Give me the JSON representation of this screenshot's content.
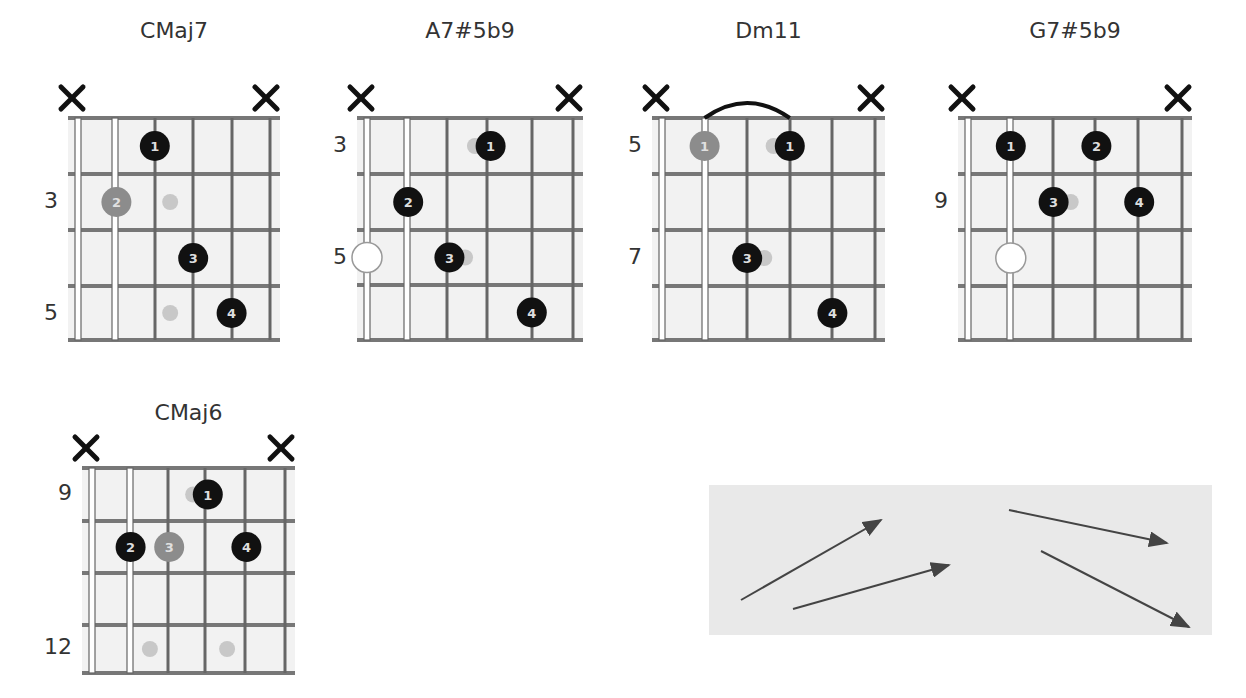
{
  "chords": [
    {
      "name": "CMaj7",
      "title_x": 68,
      "title_y": 18,
      "strings_x": [
        78,
        115,
        155,
        193,
        232,
        270
      ],
      "frets_y": [
        118,
        174,
        230,
        286,
        340
      ],
      "fret_labels": [
        {
          "text": "3",
          "y": 202
        },
        {
          "text": "5",
          "y": 314
        }
      ],
      "label_x": 24,
      "muted": [
        0,
        5
      ],
      "dots": [
        {
          "string": 2,
          "fret": 0,
          "finger": "1",
          "style": "black"
        },
        {
          "string": 1,
          "fret": 1,
          "finger": "2",
          "style": "gray"
        },
        {
          "string": 3,
          "fret": 2,
          "finger": "3",
          "style": "black"
        },
        {
          "string": 4,
          "fret": 3,
          "finger": "4",
          "style": "black"
        }
      ],
      "ghosts": [
        {
          "string": 2.4,
          "fret": 1
        },
        {
          "string": 2.4,
          "fret": 3
        }
      ],
      "open_circles": [],
      "barre": null
    },
    {
      "name": "A7#5b9",
      "title_x": 360,
      "title_y": 18,
      "strings_x": [
        367,
        407,
        447,
        487,
        532,
        573
      ],
      "frets_y": [
        118,
        174,
        230,
        285,
        340
      ],
      "fret_labels": [
        {
          "text": "3",
          "y": 146
        },
        {
          "text": "5",
          "y": 258
        }
      ],
      "label_x": 314,
      "muted": [
        0,
        5
      ],
      "dots": [
        {
          "string": 3,
          "fret": 0,
          "finger": "1",
          "style": "black"
        },
        {
          "string": 1,
          "fret": 1,
          "finger": "2",
          "style": "black"
        },
        {
          "string": 2,
          "fret": 2,
          "finger": "3",
          "style": "black"
        },
        {
          "string": 4,
          "fret": 3,
          "finger": "4",
          "style": "black"
        }
      ],
      "ghosts": [
        {
          "string": 2.62,
          "fret": 0
        },
        {
          "string": 2.38,
          "fret": 2
        }
      ],
      "open_circles": [
        {
          "string": 0,
          "fret": 2
        }
      ],
      "barre": null
    },
    {
      "name": "Dm11",
      "title_x": 660,
      "title_y": 18,
      "strings_x": [
        662,
        705,
        747,
        790,
        832,
        875
      ],
      "frets_y": [
        118,
        174,
        230,
        286,
        340
      ],
      "fret_labels": [
        {
          "text": "5",
          "y": 146
        },
        {
          "text": "7",
          "y": 258
        }
      ],
      "label_x": 606,
      "muted": [
        0,
        5
      ],
      "dots": [
        {
          "string": 1,
          "fret": 0,
          "finger": "1",
          "style": "gray"
        },
        {
          "string": 3,
          "fret": 0,
          "finger": "1",
          "style": "black"
        },
        {
          "string": 2,
          "fret": 2,
          "finger": "3",
          "style": "black"
        },
        {
          "string": 4,
          "fret": 3,
          "finger": "4",
          "style": "black"
        }
      ],
      "ghosts": [
        {
          "string": 2.62,
          "fret": 0
        },
        {
          "string": 2.4,
          "fret": 2
        }
      ],
      "open_circles": [],
      "barre": {
        "from": 1,
        "to": 3
      }
    },
    {
      "name": "G7#5b9",
      "title_x": 965,
      "title_y": 18,
      "strings_x": [
        968,
        1010,
        1053,
        1095,
        1138,
        1182
      ],
      "frets_y": [
        118,
        174,
        230,
        286,
        340
      ],
      "fret_labels": [
        {
          "text": "9",
          "y": 202
        }
      ],
      "label_x": 914,
      "muted": [
        0,
        5
      ],
      "dots": [
        {
          "string": 1,
          "fret": 0,
          "finger": "1",
          "style": "black"
        },
        {
          "string": 3,
          "fret": 0,
          "finger": "2",
          "style": "black"
        },
        {
          "string": 2,
          "fret": 1,
          "finger": "3",
          "style": "black"
        },
        {
          "string": 4,
          "fret": 1,
          "finger": "4",
          "style": "black"
        }
      ],
      "ghosts": [
        {
          "string": 2.4,
          "fret": 1
        }
      ],
      "open_circles": [
        {
          "string": 1,
          "fret": 2
        }
      ],
      "barre": null
    },
    {
      "name": "CMaj6",
      "title_x": 78,
      "title_y": 400,
      "strings_x": [
        92,
        130,
        168,
        205,
        245,
        285
      ],
      "frets_y": [
        468,
        521,
        573,
        625,
        673
      ],
      "fret_labels": [
        {
          "text": "9",
          "y": 494
        },
        {
          "text": "12",
          "y": 648
        }
      ],
      "label_x": 38,
      "muted": [
        0,
        5
      ],
      "dots": [
        {
          "string": 3,
          "fret": 0,
          "finger": "1",
          "style": "black"
        },
        {
          "string": 1,
          "fret": 1,
          "finger": "2",
          "style": "black"
        },
        {
          "string": 2,
          "fret": 1,
          "finger": "3",
          "style": "gray"
        },
        {
          "string": 4,
          "fret": 1,
          "finger": "4",
          "style": "black"
        }
      ],
      "ghosts": [
        {
          "string": 2.62,
          "fret": 0
        },
        {
          "string": 1.5,
          "fret": 3
        },
        {
          "string": 3.5,
          "fret": 3
        }
      ],
      "open_circles": [],
      "barre": null
    }
  ],
  "arrows_panel": {
    "x": 709,
    "y": 485,
    "w": 503,
    "h": 150,
    "arrows": [
      {
        "x1": 32,
        "y1": 115,
        "x2": 172,
        "y2": 35
      },
      {
        "x1": 84,
        "y1": 124,
        "x2": 240,
        "y2": 80
      },
      {
        "x1": 300,
        "y1": 25,
        "x2": 458,
        "y2": 58
      },
      {
        "x1": 332,
        "y1": 66,
        "x2": 480,
        "y2": 142
      }
    ]
  },
  "colors": {
    "fretboard": "#f2f2f2",
    "fret_line": "#777777",
    "string_line": "#666666",
    "dot_black": "#111111",
    "dot_gray": "#8c8c8c",
    "ghost": "#c8c8c8",
    "mute": "#111111",
    "arrow": "#444444",
    "panel": "#e9e9e9"
  }
}
